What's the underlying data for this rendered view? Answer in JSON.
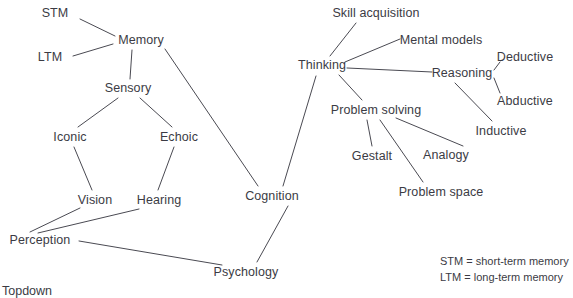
{
  "diagram": {
    "background_color": "#ffffff",
    "line_color": "#4a4a52",
    "text_color": "#3b3b44",
    "nodes": [
      {
        "id": "stm",
        "label": "STM",
        "x": 55,
        "y": 13
      },
      {
        "id": "ltm",
        "label": "LTM",
        "x": 50,
        "y": 57
      },
      {
        "id": "memory",
        "label": "Memory",
        "x": 141,
        "y": 40
      },
      {
        "id": "sensory",
        "label": "Sensory",
        "x": 128,
        "y": 88
      },
      {
        "id": "iconic",
        "label": "Iconic",
        "x": 70,
        "y": 137
      },
      {
        "id": "echoic",
        "label": "Echoic",
        "x": 179,
        "y": 137
      },
      {
        "id": "vision",
        "label": "Vision",
        "x": 95,
        "y": 200
      },
      {
        "id": "hearing",
        "label": "Hearing",
        "x": 159,
        "y": 200
      },
      {
        "id": "perception",
        "label": "Perception",
        "x": 40,
        "y": 240
      },
      {
        "id": "psychology",
        "label": "Psychology",
        "x": 246,
        "y": 272
      },
      {
        "id": "cognition",
        "label": "Cognition",
        "x": 272,
        "y": 196
      },
      {
        "id": "thinking",
        "label": "Thinking",
        "x": 322,
        "y": 65
      },
      {
        "id": "skill-acquisition",
        "label": "Skill acquisition",
        "x": 376,
        "y": 13
      },
      {
        "id": "mental-models",
        "label": "Mental models",
        "x": 441,
        "y": 40
      },
      {
        "id": "reasoning",
        "label": "Reasoning",
        "x": 462,
        "y": 73
      },
      {
        "id": "deductive",
        "label": "Deductive",
        "x": 525,
        "y": 57
      },
      {
        "id": "abductive",
        "label": "Abductive",
        "x": 525,
        "y": 101
      },
      {
        "id": "inductive",
        "label": "Inductive",
        "x": 501,
        "y": 131
      },
      {
        "id": "problem-solving",
        "label": "Problem solving",
        "x": 376,
        "y": 110
      },
      {
        "id": "gestalt",
        "label": "Gestalt",
        "x": 372,
        "y": 156
      },
      {
        "id": "analogy",
        "label": "Analogy",
        "x": 446,
        "y": 155
      },
      {
        "id": "problem-space",
        "label": "Problem space",
        "x": 441,
        "y": 192
      }
    ],
    "edges": [
      {
        "from": "stm",
        "to": "memory",
        "x1": 80,
        "y1": 19,
        "x2": 115,
        "y2": 36
      },
      {
        "from": "ltm",
        "to": "memory",
        "x1": 73,
        "y1": 56,
        "x2": 113,
        "y2": 44
      },
      {
        "from": "memory",
        "to": "sensory",
        "x1": 132,
        "y1": 50,
        "x2": 130,
        "y2": 79
      },
      {
        "from": "memory",
        "to": "cognition",
        "x1": 165,
        "y1": 49,
        "x2": 258,
        "y2": 186
      },
      {
        "from": "sensory",
        "to": "iconic",
        "x1": 118,
        "y1": 98,
        "x2": 78,
        "y2": 127
      },
      {
        "from": "sensory",
        "to": "echoic",
        "x1": 140,
        "y1": 98,
        "x2": 172,
        "y2": 127
      },
      {
        "from": "iconic",
        "to": "vision",
        "x1": 74,
        "y1": 147,
        "x2": 92,
        "y2": 190
      },
      {
        "from": "echoic",
        "to": "hearing",
        "x1": 174,
        "y1": 147,
        "x2": 158,
        "y2": 190
      },
      {
        "from": "vision",
        "to": "perception",
        "x1": 80,
        "y1": 208,
        "x2": 30,
        "y2": 232
      },
      {
        "from": "hearing",
        "to": "perception",
        "x1": 139,
        "y1": 209,
        "x2": 38,
        "y2": 233
      },
      {
        "from": "perception",
        "to": "psychology",
        "x1": 79,
        "y1": 241,
        "x2": 222,
        "y2": 265
      },
      {
        "from": "psychology",
        "to": "cognition",
        "x1": 257,
        "y1": 262,
        "x2": 288,
        "y2": 206
      },
      {
        "from": "cognition",
        "to": "thinking",
        "x1": 283,
        "y1": 186,
        "x2": 316,
        "y2": 76
      },
      {
        "from": "thinking",
        "to": "skill-acquisition",
        "x1": 330,
        "y1": 56,
        "x2": 356,
        "y2": 23
      },
      {
        "from": "thinking",
        "to": "mental-models",
        "x1": 345,
        "y1": 62,
        "x2": 400,
        "y2": 39
      },
      {
        "from": "thinking",
        "to": "reasoning",
        "x1": 347,
        "y1": 68,
        "x2": 432,
        "y2": 72
      },
      {
        "from": "thinking",
        "to": "problem-solving",
        "x1": 339,
        "y1": 75,
        "x2": 362,
        "y2": 100
      },
      {
        "from": "reasoning",
        "to": "deductive",
        "x1": 494,
        "y1": 70,
        "x2": 500,
        "y2": 62
      },
      {
        "from": "reasoning",
        "to": "abductive",
        "x1": 494,
        "y1": 78,
        "x2": 500,
        "y2": 93
      },
      {
        "from": "reasoning",
        "to": "inductive",
        "x1": 455,
        "y1": 83,
        "x2": 492,
        "y2": 121
      },
      {
        "from": "problem-solving",
        "to": "gestalt",
        "x1": 367,
        "y1": 120,
        "x2": 372,
        "y2": 146
      },
      {
        "from": "problem-solving",
        "to": "problem-space",
        "x1": 380,
        "y1": 120,
        "x2": 423,
        "y2": 182
      },
      {
        "from": "problem-solving",
        "to": "analogy",
        "x1": 396,
        "y1": 118,
        "x2": 463,
        "y2": 146
      }
    ],
    "legend": {
      "line1": "STM = short-term memory",
      "line2": "LTM = long-term memory",
      "x": 440,
      "y": 254
    },
    "caption": {
      "text": "Topdown",
      "x": 2,
      "y": 285
    }
  }
}
